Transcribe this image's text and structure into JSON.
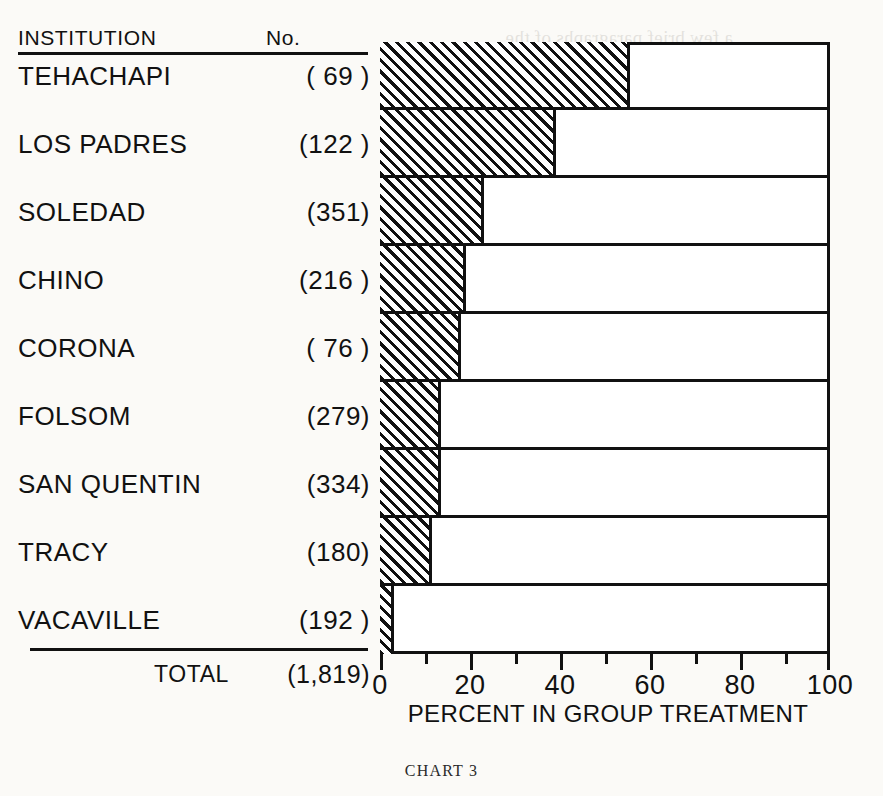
{
  "table": {
    "header_institution": "INSTITUTION",
    "header_number": "No.",
    "total_label": "TOTAL",
    "total_count": "(1,819)"
  },
  "axis": {
    "title": "PERCENT IN GROUP TREATMENT",
    "ticks": [
      "0",
      "20",
      "40",
      "60",
      "80",
      "100"
    ]
  },
  "caption": "CHART 3",
  "rows": [
    {
      "name": "TEHACHAPI",
      "count": "( 69 )",
      "percent": 55.5
    },
    {
      "name": "LOS PADRES",
      "count": "(122 )",
      "percent": 39.0
    },
    {
      "name": "SOLEDAD",
      "count": "(351)",
      "percent": 23.0
    },
    {
      "name": "CHINO",
      "count": "(216 )",
      "percent": 19.0
    },
    {
      "name": "CORONA",
      "count": "( 76 )",
      "percent": 18.0
    },
    {
      "name": "FOLSOM",
      "count": "(279)",
      "percent": 13.5
    },
    {
      "name": "SAN QUENTIN",
      "count": "(334)",
      "percent": 13.5
    },
    {
      "name": "TRACY",
      "count": "(180)",
      "percent": 11.5
    },
    {
      "name": "VACAVILLE",
      "count": "(192 )",
      "percent": 3.0
    }
  ],
  "chart_data": {
    "type": "bar",
    "orientation": "horizontal",
    "title": "CHART 3",
    "xlabel": "PERCENT IN GROUP TREATMENT",
    "ylabel": "INSTITUTION",
    "xlim": [
      0,
      100
    ],
    "xticks": [
      0,
      20,
      40,
      60,
      80,
      100
    ],
    "minor_tick_interval": 10,
    "grid": false,
    "legend": "none",
    "categories": [
      "TEHACHAPI",
      "LOS PADRES",
      "SOLEDAD",
      "CHINO",
      "CORONA",
      "FOLSOM",
      "SAN QUENTIN",
      "TRACY",
      "VACAVILLE"
    ],
    "values": [
      55.5,
      39.0,
      23.0,
      19.0,
      18.0,
      13.5,
      13.5,
      11.5,
      3.0
    ],
    "counts": [
      69,
      122,
      351,
      216,
      76,
      279,
      334,
      180,
      192
    ],
    "count_labels": [
      "( 69 )",
      "(122 )",
      "(351)",
      "(216 )",
      "( 76 )",
      "(279)",
      "(334)",
      "(180)",
      "(192 )"
    ],
    "total_count": 1819,
    "total_label": "TOTAL (1,819)",
    "bar_style": "diagonal-hatch"
  },
  "bleed_lines": [
    "a few brief paragraphs of the",
    "of this leaflet is to present",
    "described. The appropriate",
    "to the standards of",
    "and it will be noticed",
    "more groups and allow",
    "early to declare and full",
    "summation more restric",
    "group activities and the",
    "should have been held"
  ]
}
